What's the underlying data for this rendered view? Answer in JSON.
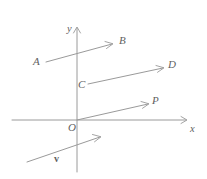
{
  "figure": {
    "type": "vector-diagram",
    "width": 207,
    "height": 179,
    "background_color": "#ffffff",
    "stroke_color": "#9a9a9a",
    "label_color": "#5f5f5f",
    "axes": {
      "x_axis": {
        "label": "x",
        "label_x": 190,
        "label_y": 124,
        "from": [
          12,
          120
        ],
        "to": [
          186,
          120
        ],
        "arrow_at": "end"
      },
      "y_axis": {
        "label": "y",
        "label_x": 67,
        "label_y": 24,
        "from": [
          77,
          172
        ],
        "to": [
          77,
          28
        ],
        "arrow_at": "end"
      },
      "origin": {
        "label": "O",
        "label_x": 68,
        "label_y": 122,
        "point": [
          77,
          120
        ]
      }
    },
    "vectors": [
      {
        "name": "AB",
        "tail_label": "A",
        "head_label": "B",
        "tail_label_x": 33,
        "tail_label_y": 56,
        "head_label_x": 119,
        "head_label_y": 35,
        "from": [
          46,
          62
        ],
        "to": [
          112,
          44
        ]
      },
      {
        "name": "CD",
        "tail_label": "C",
        "head_label": "D",
        "tail_label_x": 78,
        "tail_label_y": 79,
        "head_label_x": 168,
        "head_label_y": 59,
        "from": [
          88,
          84
        ],
        "to": [
          163,
          68
        ]
      },
      {
        "name": "OP",
        "tail_label": "",
        "head_label": "P",
        "tail_label_x": 0,
        "tail_label_y": 0,
        "head_label_x": 152,
        "head_label_y": 95,
        "from": [
          77,
          120
        ],
        "to": [
          148,
          104
        ]
      },
      {
        "name": "v",
        "tail_label": "",
        "head_label": "v",
        "tail_label_x": 0,
        "tail_label_y": 0,
        "head_label_x": 54,
        "head_label_y": 154,
        "from": [
          27,
          162
        ],
        "to": [
          100,
          137
        ]
      }
    ]
  }
}
